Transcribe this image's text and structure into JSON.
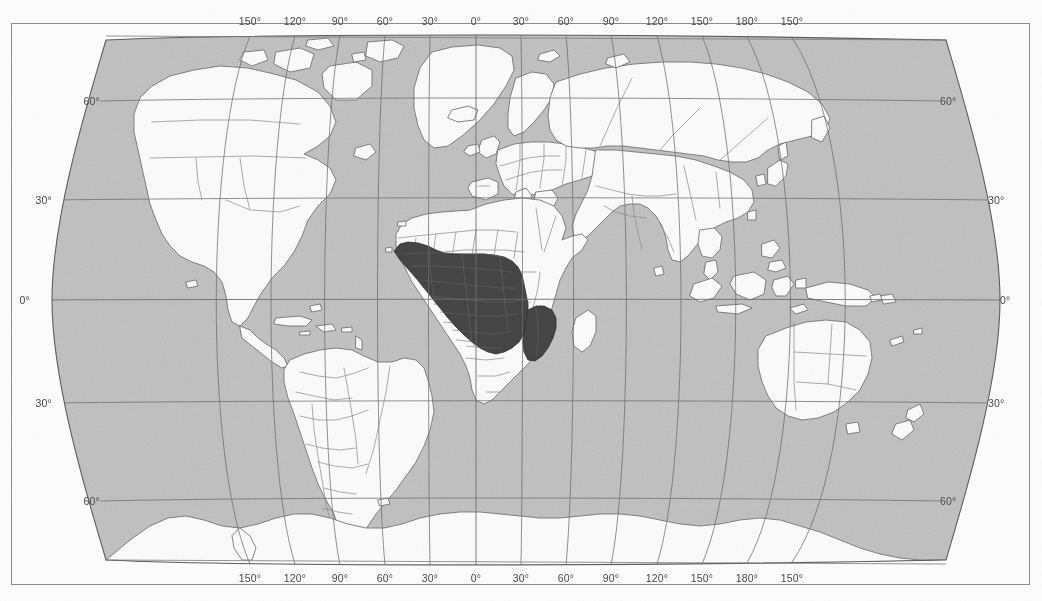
{
  "figure": {
    "projection": "Robinson",
    "frame_color": "#8d8d8d",
    "background_color": "#ffffff"
  },
  "legend_colors": {
    "ocean": "#c2c2c2",
    "land": "#fbfbfb",
    "land_border": "#6f6f6f",
    "highlight_range": "#454545",
    "graticule": "#7a7a7a",
    "label_text": "#4a4a4a"
  },
  "graticule": {
    "longitude_labels_top": [
      "150°",
      "120°",
      "90°",
      "60°",
      "30°",
      "0°",
      "30°",
      "60°",
      "90°",
      "120°",
      "150°",
      "180°",
      "150°"
    ],
    "longitude_labels_bottom": [
      "150°",
      "120°",
      "90°",
      "60°",
      "30°",
      "0°",
      "30°",
      "60°",
      "90°",
      "120°",
      "150°",
      "180°",
      "150°"
    ],
    "longitude_x_positions": [
      250,
      295,
      340,
      385,
      430,
      476,
      521,
      566,
      611,
      657,
      702,
      747,
      792
    ],
    "latitude_labels_left": [
      "60°",
      "30°",
      "0°",
      "30°",
      "60°"
    ],
    "latitude_labels_right": [
      "60°",
      "30°",
      "0°",
      "30°",
      "60°"
    ],
    "latitude_y_positions": [
      101,
      200,
      300,
      403,
      501
    ],
    "latitude_left_x": [
      100,
      52,
      30,
      52,
      100
    ],
    "latitude_right_x": [
      940,
      988,
      1000,
      988,
      940
    ],
    "lon_label_top_y": 16,
    "lon_label_bottom_y": 573,
    "spacing_degrees": 30
  },
  "chart_data": {
    "type": "map",
    "projection": "Robinson",
    "highlighted_region_label": "Sub-Saharan Africa distribution range",
    "highlighted_region_color": "#454545",
    "highlighted_extent": {
      "west_longitude": "17°W",
      "east_longitude": "40°E",
      "north_latitude": "15°N",
      "south_latitude": "26°S"
    },
    "axis_x_label": "Longitude",
    "axis_y_label": "Latitude",
    "x_ticks": [
      "150°",
      "120°",
      "90°",
      "60°",
      "30°",
      "0°",
      "30°",
      "60°",
      "90°",
      "120°",
      "150°",
      "180°",
      "150°"
    ],
    "y_ticks": [
      "60°",
      "30°",
      "0°",
      "30°",
      "60°"
    ],
    "grid": true,
    "legend": "none"
  }
}
